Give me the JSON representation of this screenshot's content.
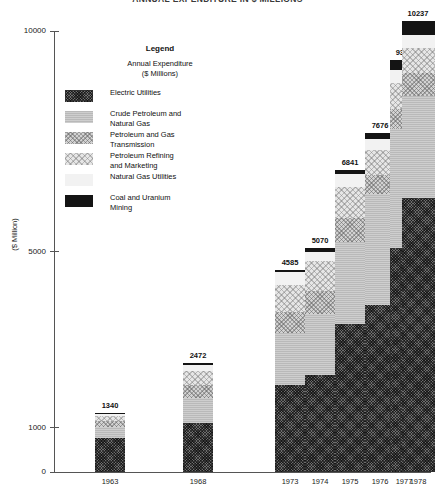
{
  "chart_data": {
    "type": "bar",
    "subtype": "stacked-bar",
    "title": "ANNUAL EXPENDITURE IN $ MILLIONS",
    "xlabel": "",
    "ylabel": "($ Million)",
    "ylim": [
      0,
      10500
    ],
    "yticks": [
      0,
      1000,
      5000,
      10000
    ],
    "ytick_labels": [
      "0",
      "1000",
      "5000",
      "10000"
    ],
    "grid": false,
    "legend_position": "upper-left-inside",
    "categories": [
      "1963",
      "1968",
      "1973",
      "1974",
      "1975",
      "1976",
      "1977",
      "1978"
    ],
    "totals": [
      1340,
      2472,
      4585,
      5070,
      6841,
      7676,
      9343,
      10237
    ],
    "total_labels": [
      "1340",
      "2472",
      "4585",
      "5070",
      "6841",
      "7676",
      "9343",
      "10237"
    ],
    "series": [
      {
        "name": "Electric Utilities",
        "key": "electric-utilities",
        "swatch": "dark-crosshatch",
        "color": "#6d6d6d",
        "values": [
          760,
          1110,
          1980,
          2210,
          3360,
          3780,
          5070,
          6220
        ]
      },
      {
        "name": "Crude Petroleum and Natural Gas",
        "key": "crude-petroleum-and-natural-gas",
        "swatch": "medium-gray",
        "color": "#b9b9b9",
        "values": [
          250,
          560,
          1170,
          1380,
          1850,
          2530,
          2710,
          2300
        ]
      },
      {
        "name": "Petroleum and Gas Transmission",
        "key": "petroleum-and-gas-transmission",
        "swatch": "light-gray-speckle",
        "color": "#d2d2d2",
        "values": [
          150,
          300,
          480,
          520,
          560,
          430,
          450,
          530
        ]
      },
      {
        "name": "Petroleum Refining and Marketing",
        "key": "petroleum-refining-and-marketing",
        "swatch": "very-light-dots",
        "color": "#e6e6e6",
        "values": [
          120,
          330,
          620,
          680,
          690,
          560,
          600,
          560
        ]
      },
      {
        "name": "Natural Gas Utilities",
        "key": "natural-gas-utilities",
        "swatch": "near-white",
        "color": "#f2f2f2",
        "values": [
          45,
          120,
          275,
          200,
          300,
          250,
          290,
          310
        ]
      },
      {
        "name": "Coal and Uranium Mining",
        "key": "coal-and-uranium-mining",
        "swatch": "solid-black",
        "color": "#141414",
        "values": [
          15,
          52,
          60,
          80,
          81,
          126,
          223,
          317
        ]
      }
    ]
  },
  "legend": {
    "title": "Legend",
    "subtitle": "Annual Expenditure\n($ Millions)",
    "items": [
      {
        "label": "Electric Utilities"
      },
      {
        "label": "Crude Petroleum and\nNatural Gas"
      },
      {
        "label": "Petroleum and Gas\nTransmission"
      },
      {
        "label": "Petroleum Refining\nand Marketing"
      },
      {
        "label": "Natural Gas Utilities"
      },
      {
        "label": "Coal and Uranium\nMining"
      }
    ]
  }
}
